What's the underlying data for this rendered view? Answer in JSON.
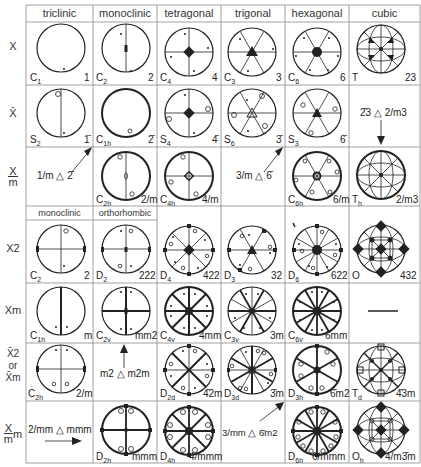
{
  "columns": [
    "triclinic",
    "monoclinic",
    "tetragonal",
    "trigonal",
    "hexagonal",
    "cubic"
  ],
  "subheader": [
    "monoclinic",
    "orthorhombic"
  ],
  "row_labels": {
    "x": "X",
    "xbar": "X̄",
    "x_over_m_num": "X",
    "x_over_m_den": "m",
    "x2": "X2",
    "xm": "Xm",
    "xbar2_a": "X̄2",
    "xbar2_or": "or",
    "xbar2_b": "X̄m",
    "xmm_num": "X",
    "xmm_den": "m",
    "xmm_m": "m"
  },
  "cells": {
    "r1": [
      {
        "schoen": "C",
        "sub": "1",
        "hm": "1"
      },
      {
        "schoen": "C",
        "sub": "2",
        "hm": "2"
      },
      {
        "schoen": "C",
        "sub": "4",
        "hm": "4"
      },
      {
        "schoen": "C",
        "sub": "3",
        "hm": "3"
      },
      {
        "schoen": "C",
        "sub": "6",
        "hm": "6"
      },
      {
        "schoen": "T",
        "sub": "",
        "hm": "23"
      }
    ],
    "r2": [
      {
        "schoen": "S",
        "sub": "2",
        "hm": "1̄"
      },
      {
        "schoen": "C",
        "sub": "1h",
        "hm": "2̄"
      },
      {
        "schoen": "S",
        "sub": "4",
        "hm": "4̄"
      },
      {
        "schoen": "S",
        "sub": "6",
        "hm": "3̄"
      },
      {
        "schoen": "S",
        "sub": "3",
        "hm": "6̄"
      },
      {
        "note": "2̄3 △ 2/m3"
      }
    ],
    "r3": [
      {
        "note": "1/m △ 2̄"
      },
      {
        "schoen": "C",
        "sub": "2h",
        "hm": "2/m"
      },
      {
        "schoen": "C",
        "sub": "4h",
        "hm": "4/m"
      },
      {
        "note": "3/m △ 6̄"
      },
      {
        "schoen": "C",
        "sub": "6h",
        "hm": "6/m"
      },
      {
        "schoen": "T",
        "sub": "h",
        "hm": "2/m3"
      }
    ],
    "r4": [
      {
        "schoen": "C",
        "sub": "2",
        "hm": "2"
      },
      {
        "schoen": "D",
        "sub": "2",
        "hm": "222"
      },
      {
        "schoen": "D",
        "sub": "4",
        "hm": "422"
      },
      {
        "schoen": "D",
        "sub": "3",
        "hm": "32"
      },
      {
        "schoen": "D",
        "sub": "6",
        "hm": "622"
      },
      {
        "schoen": "O",
        "sub": "",
        "hm": "432"
      }
    ],
    "r5": [
      {
        "schoen": "C",
        "sub": "1h",
        "hm": "m"
      },
      {
        "schoen": "C",
        "sub": "2v",
        "hm": "mm2"
      },
      {
        "schoen": "C",
        "sub": "4v",
        "hm": "4mm"
      },
      {
        "schoen": "C",
        "sub": "3v",
        "hm": "3m"
      },
      {
        "schoen": "C",
        "sub": "6v",
        "hm": "6mm"
      },
      {
        "note": "—"
      }
    ],
    "r6": [
      {
        "schoen": "C",
        "sub": "2h",
        "hm": "2/m"
      },
      {
        "note": "m2 △ m2m"
      },
      {
        "schoen": "D",
        "sub": "2d",
        "hm": "4̄2m"
      },
      {
        "schoen": "D",
        "sub": "3d",
        "hm": "3̄m"
      },
      {
        "schoen": "D",
        "sub": "3h",
        "hm": "6̄m2"
      },
      {
        "schoen": "T",
        "sub": "d",
        "hm": "4̄3m"
      }
    ],
    "r7": [
      {
        "note": "2/mm △ mmm"
      },
      {
        "schoen": "D",
        "sub": "2h",
        "hm": "mmm"
      },
      {
        "schoen": "D",
        "sub": "4h",
        "hm": "4/mmm"
      },
      {
        "note": "3/mm △ 6̄m2"
      },
      {
        "schoen": "D",
        "sub": "6h",
        "hm": "6/mmm"
      },
      {
        "schoen": "O",
        "sub": "h",
        "hm": "4/m3̄m"
      }
    ]
  },
  "colors": {
    "line": "#222222",
    "grid": "#888888",
    "background": "#ffffff"
  }
}
